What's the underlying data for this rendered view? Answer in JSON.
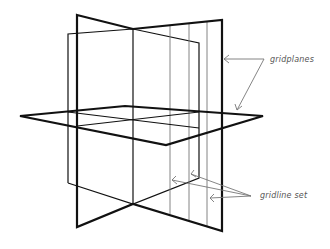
{
  "diagram": {
    "labels": {
      "gridplanes": "gridplanes",
      "gridline_set": "gridline set"
    },
    "colors": {
      "plane_stroke": "#111111",
      "annotation_stroke": "#777777",
      "background": "#ffffff"
    },
    "elements": {
      "thick_vertical_plane": "gridplane (front, thick outline)",
      "thin_vertical_plane": "gridplane (back, thin outline)",
      "horizontal_plane": "gridplane (horizontal)",
      "gridlines_count": 3
    }
  }
}
